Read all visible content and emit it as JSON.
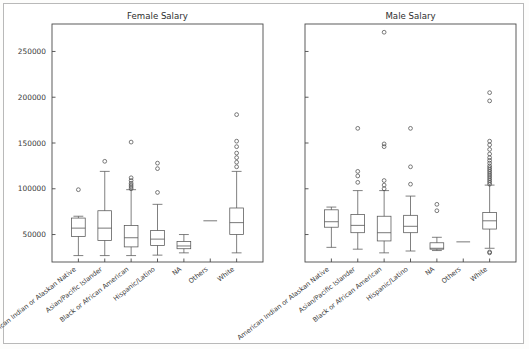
{
  "figure": {
    "background": "#ffffff",
    "frame_color": "#b9b9b9"
  },
  "panels": [
    {
      "id": "female",
      "title": "Female Salary"
    },
    {
      "id": "male",
      "title": "Male Salary"
    }
  ],
  "chart_data": {
    "type": "box",
    "title": "",
    "subtitle": "",
    "xlabel": "",
    "ylabel": "",
    "ylim": [
      20000,
      280000
    ],
    "grid": false,
    "legend": null,
    "yticks": [
      50000,
      100000,
      150000,
      200000,
      250000
    ],
    "ytick_labels": [
      "50000",
      "100000",
      "150000",
      "200000",
      "250000"
    ],
    "categories": [
      "American Indian or Alaskan Native",
      "Asian/Pacific Islander",
      "Black or African American",
      "Hispanic/Latino",
      "NA",
      "Others",
      "White"
    ],
    "panels": [
      {
        "name": "Female Salary",
        "boxes": [
          {
            "category": "American Indian or Alaskan Native",
            "whislo": 27000,
            "q1": 48000,
            "med": 57000,
            "q3": 68000,
            "whishi": 70000,
            "fliers": [
              99000
            ]
          },
          {
            "category": "Asian/Pacific Islander",
            "whislo": 27000,
            "q1": 43500,
            "med": 57000,
            "q3": 76000,
            "whishi": 119000,
            "fliers": [
              130000
            ]
          },
          {
            "category": "Black or African American",
            "whislo": 27000,
            "q1": 36500,
            "med": 46500,
            "q3": 60000,
            "whishi": 99000,
            "fliers": [
              100000,
              102000,
              104000,
              106000,
              109000,
              112000,
              151000
            ]
          },
          {
            "category": "Hispanic/Latino",
            "whislo": 27500,
            "q1": 38000,
            "med": 45000,
            "q3": 54500,
            "whishi": 83000,
            "fliers": [
              96000,
              122000,
              128000
            ]
          },
          {
            "category": "NA",
            "whislo": 30000,
            "q1": 34500,
            "med": 37500,
            "q3": 42500,
            "whishi": 50000,
            "fliers": []
          },
          {
            "category": "Others",
            "whislo": 65000,
            "q1": 65000,
            "med": 65000,
            "q3": 65000,
            "whishi": 65000,
            "fliers": []
          },
          {
            "category": "White",
            "whislo": 30000,
            "q1": 50000,
            "med": 63000,
            "q3": 79000,
            "whishi": 119000,
            "fliers": [
              124000,
              129000,
              134000,
              139000,
              146000,
              152000,
              181000
            ]
          }
        ]
      },
      {
        "name": "Male Salary",
        "boxes": [
          {
            "category": "American Indian or Alaskan Native",
            "whislo": 36000,
            "q1": 58000,
            "med": 64000,
            "q3": 77000,
            "whishi": 80000,
            "fliers": []
          },
          {
            "category": "Asian/Pacific Islander",
            "whislo": 34000,
            "q1": 52000,
            "med": 60000,
            "q3": 72000,
            "whishi": 98000,
            "fliers": [
              107000,
              114000,
              119000,
              166000
            ]
          },
          {
            "category": "Black or African American",
            "whislo": 30000,
            "q1": 43000,
            "med": 52000,
            "q3": 70000,
            "whishi": 98000,
            "fliers": [
              100000,
              104000,
              109000,
              146000,
              149000,
              271000
            ]
          },
          {
            "category": "Hispanic/Latino",
            "whislo": 32000,
            "q1": 52000,
            "med": 59000,
            "q3": 71000,
            "whishi": 92000,
            "fliers": [
              105000,
              124000,
              166000
            ]
          },
          {
            "category": "NA",
            "whislo": 32500,
            "q1": 34000,
            "med": 35000,
            "q3": 41000,
            "whishi": 47000,
            "fliers": [
              76000,
              83000
            ]
          },
          {
            "category": "Others",
            "whislo": 42000,
            "q1": 42000,
            "med": 42000,
            "q3": 42000,
            "whishi": 42000,
            "fliers": []
          },
          {
            "category": "White",
            "whislo": 35000,
            "q1": 56000,
            "med": 65000,
            "q3": 74000,
            "whishi": 104000,
            "fliers": [
              30000,
              31000,
              105000,
              107000,
              109000,
              111000,
              113000,
              115000,
              117000,
              119000,
              121000,
              123000,
              125000,
              128000,
              131000,
              134000,
              138000,
              143000,
              148000,
              152000,
              196000,
              205000
            ]
          }
        ]
      }
    ]
  }
}
